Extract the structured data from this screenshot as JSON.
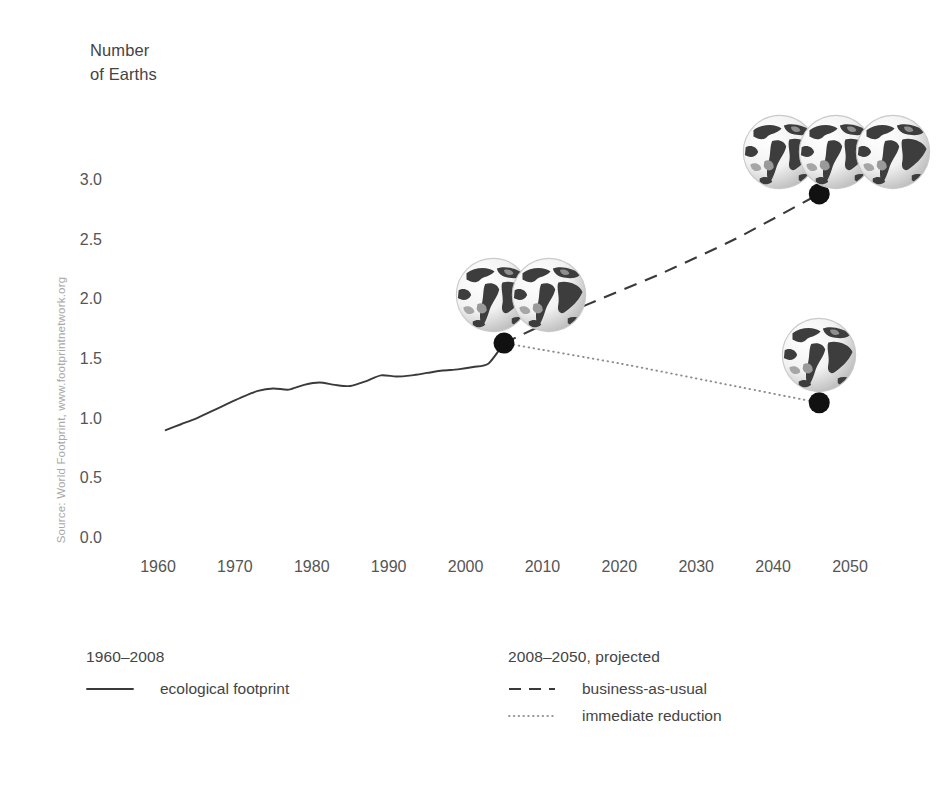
{
  "chart_data": {
    "type": "line",
    "title": "",
    "ylabel": "Number of Earths",
    "xlabel": "",
    "ylim": [
      0.0,
      3.25
    ],
    "xlim": [
      1956,
      2052
    ],
    "grid": false,
    "legend_position": "bottom",
    "y_ticks": [
      "0.0",
      "0.5",
      "1.0",
      "1.5",
      "2.0",
      "2.5",
      "3.0"
    ],
    "y_tick_values": [
      0.0,
      0.5,
      1.0,
      1.5,
      2.0,
      2.5,
      3.0
    ],
    "x_ticks": [
      "1960",
      "1970",
      "1980",
      "1990",
      "2000",
      "2010",
      "2020",
      "2030",
      "2040",
      "2050"
    ],
    "x_tick_values": [
      1960,
      1970,
      1980,
      1990,
      2000,
      2010,
      2020,
      2030,
      2040,
      2050
    ],
    "series": [
      {
        "name": "ecological footprint",
        "style": "solid",
        "period": "1960-2008",
        "x": [
          1961,
          1963,
          1965,
          1967,
          1969,
          1971,
          1973,
          1975,
          1977,
          1979,
          1981,
          1983,
          1985,
          1987,
          1989,
          1991,
          1993,
          1995,
          1997,
          1999,
          2001,
          2003,
          2005
        ],
        "values": [
          0.92,
          0.97,
          1.02,
          1.08,
          1.14,
          1.2,
          1.25,
          1.27,
          1.26,
          1.3,
          1.32,
          1.3,
          1.29,
          1.33,
          1.38,
          1.37,
          1.38,
          1.4,
          1.42,
          1.43,
          1.45,
          1.48,
          1.65
        ]
      },
      {
        "name": "business-as-usual",
        "style": "dashed",
        "period": "2008-2050, projected",
        "x": [
          2005,
          2015,
          2025,
          2035,
          2046
        ],
        "values": [
          1.65,
          1.95,
          2.22,
          2.52,
          2.9
        ]
      },
      {
        "name": "immediate reduction",
        "style": "dotted",
        "period": "2008-2050, projected",
        "x": [
          2005,
          2020,
          2035,
          2046
        ],
        "values": [
          1.65,
          1.48,
          1.29,
          1.15
        ]
      }
    ],
    "markers": [
      {
        "name": "branch-point",
        "x": 2005,
        "y": 1.65
      },
      {
        "name": "business-as-usual-endpoint",
        "x": 2046,
        "y": 2.9
      },
      {
        "name": "immediate-reduction-endpoint",
        "x": 2046,
        "y": 1.15
      }
    ],
    "annotations": [
      {
        "name": "globes-branch",
        "count": 2,
        "x": 2005,
        "y": 2.05,
        "meaning": "about 1.5 Earths"
      },
      {
        "name": "globes-business-as-usual",
        "count": 3,
        "x": 2046,
        "y": 3.25,
        "meaning": "about 3 Earths"
      },
      {
        "name": "globe-immediate-reduction",
        "count": 1,
        "x": 2046,
        "y": 1.55,
        "meaning": "about 1 Earth"
      }
    ]
  },
  "axis": {
    "y_title_line1": "Number",
    "y_title_line2": "of Earths"
  },
  "source": {
    "text": "Source: World Footprint, www.footprintnetwork.org"
  },
  "legend": {
    "left": {
      "heading": "1960–2008",
      "items": [
        {
          "label": "ecological footprint",
          "style": "solid"
        }
      ]
    },
    "right": {
      "heading": "2008–2050, projected",
      "items": [
        {
          "label": "business-as-usual",
          "style": "dashed"
        },
        {
          "label": "immediate reduction",
          "style": "dotted"
        }
      ]
    }
  },
  "colors": {
    "line": "#3a3a3a",
    "dotted": "#8a8a8a",
    "text": "#4a4a4a",
    "tick": "#555555",
    "source": "#a8a8a8",
    "background": "#ffffff"
  }
}
